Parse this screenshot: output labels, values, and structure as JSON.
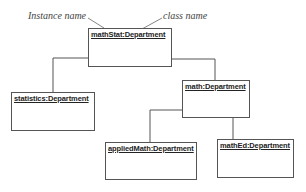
{
  "annotations": {
    "instance_label": "Instance name",
    "class_label": "class name"
  },
  "objects": [
    {
      "id": "mathStat",
      "label": "mathStat:Department"
    },
    {
      "id": "statistics",
      "label": "statistics:Department"
    },
    {
      "id": "math",
      "label": "math:Department"
    },
    {
      "id": "appliedMath",
      "label": "appliedMath:Department"
    },
    {
      "id": "mathEd",
      "label": "mathEd:Department"
    }
  ],
  "links": [
    {
      "from": "mathStat",
      "to": "statistics"
    },
    {
      "from": "mathStat",
      "to": "math"
    },
    {
      "from": "math",
      "to": "appliedMath"
    },
    {
      "from": "math",
      "to": "mathEd"
    }
  ]
}
